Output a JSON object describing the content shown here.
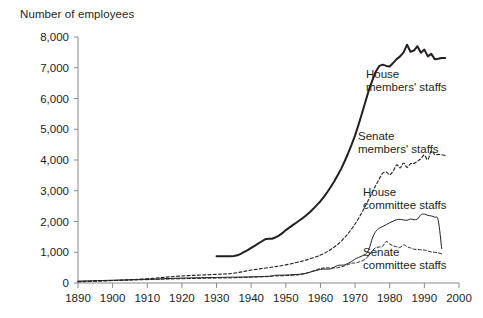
{
  "chart_data": {
    "type": "line",
    "title": "Number of employees",
    "xlabel": "",
    "ylabel": "Number of employees",
    "xlim": [
      1890,
      2000
    ],
    "ylim": [
      0,
      8000
    ],
    "xticks": [
      1890,
      1900,
      1910,
      1920,
      1930,
      1940,
      1950,
      1960,
      1970,
      1980,
      1990,
      2000
    ],
    "yticks": [
      0,
      1000,
      2000,
      3000,
      4000,
      5000,
      6000,
      7000,
      8000
    ],
    "xtick_labels": [
      "1890",
      "1900",
      "1910",
      "1920",
      "1930",
      "1940",
      "1950",
      "1960",
      "1970",
      "1980",
      "1990",
      "2000"
    ],
    "ytick_labels": [
      "0",
      "1,000",
      "2,000",
      "3,000",
      "4,000",
      "5,000",
      "6,000",
      "7,000",
      "8,000"
    ],
    "grid": false,
    "legend_position": "inline-annotations",
    "line_color": "#231f20",
    "series": [
      {
        "name": "House members' staffs",
        "style": "solid",
        "width": 2.0,
        "label_x": 1972,
        "label_y": 6550,
        "x": [
          1930,
          1931,
          1932,
          1933,
          1934,
          1935,
          1936,
          1937,
          1938,
          1939,
          1940,
          1941,
          1942,
          1943,
          1944,
          1945,
          1946,
          1947,
          1948,
          1949,
          1950,
          1951,
          1952,
          1953,
          1954,
          1955,
          1956,
          1957,
          1958,
          1959,
          1960,
          1961,
          1962,
          1963,
          1964,
          1965,
          1966,
          1967,
          1968,
          1969,
          1970,
          1971,
          1972,
          1973,
          1974,
          1975,
          1976,
          1977,
          1978,
          1979,
          1980,
          1981,
          1982,
          1983,
          1984,
          1985,
          1986,
          1987,
          1988,
          1989,
          1990,
          1991,
          1992,
          1993,
          1994,
          1995,
          1996
        ],
        "y": [
          870,
          870,
          870,
          870,
          870,
          875,
          900,
          950,
          1010,
          1070,
          1140,
          1210,
          1280,
          1350,
          1420,
          1440,
          1440,
          1480,
          1540,
          1620,
          1720,
          1800,
          1880,
          1960,
          2040,
          2120,
          2210,
          2310,
          2420,
          2540,
          2660,
          2800,
          2960,
          3130,
          3310,
          3510,
          3720,
          3960,
          4220,
          4500,
          4800,
          5150,
          5520,
          5900,
          6280,
          6600,
          6880,
          7060,
          7100,
          7060,
          7040,
          7160,
          7280,
          7370,
          7500,
          7750,
          7520,
          7560,
          7700,
          7490,
          7590,
          7370,
          7450,
          7280,
          7290,
          7320,
          7320
        ]
      },
      {
        "name": "Senate members' staffs",
        "style": "dashed",
        "width": 1.1,
        "label_x": 1972,
        "label_y": 4780,
        "x": [
          1890,
          1900,
          1910,
          1920,
          1930,
          1935,
          1940,
          1945,
          1950,
          1955,
          1957,
          1959,
          1960,
          1961,
          1962,
          1963,
          1964,
          1965,
          1966,
          1967,
          1968,
          1969,
          1970,
          1971,
          1972,
          1973,
          1974,
          1975,
          1976,
          1977,
          1978,
          1979,
          1980,
          1981,
          1982,
          1983,
          1984,
          1985,
          1986,
          1987,
          1988,
          1989,
          1990,
          1991,
          1992,
          1993,
          1994,
          1995,
          1996
        ],
        "y": [
          40,
          80,
          140,
          230,
          280,
          320,
          420,
          500,
          590,
          720,
          790,
          860,
          910,
          960,
          1020,
          1090,
          1170,
          1260,
          1360,
          1480,
          1610,
          1760,
          1920,
          2100,
          2300,
          2510,
          2730,
          2960,
          3180,
          3390,
          3570,
          3610,
          3520,
          3640,
          3840,
          3740,
          3900,
          3760,
          3880,
          3890,
          3960,
          4050,
          4160,
          4010,
          4290,
          4180,
          4180,
          4170,
          4150
        ]
      },
      {
        "name": "House committee staffs",
        "style": "solid",
        "width": 1.0,
        "label_x": 1973,
        "label_y": 2780,
        "x": [
          1890,
          1900,
          1910,
          1920,
          1930,
          1935,
          1940,
          1945,
          1947,
          1950,
          1955,
          1960,
          1963,
          1965,
          1967,
          1969,
          1970,
          1971,
          1972,
          1973,
          1974,
          1975,
          1976,
          1977,
          1978,
          1979,
          1980,
          1981,
          1982,
          1983,
          1984,
          1985,
          1986,
          1987,
          1988,
          1989,
          1990,
          1991,
          1992,
          1993,
          1994,
          1995
        ],
        "y": [
          60,
          90,
          120,
          160,
          180,
          190,
          200,
          220,
          250,
          260,
          300,
          440,
          460,
          570,
          590,
          700,
          780,
          830,
          880,
          930,
          1100,
          1460,
          1680,
          1780,
          1840,
          1900,
          1960,
          2010,
          2060,
          2070,
          2050,
          2040,
          2080,
          2060,
          2080,
          2220,
          2240,
          2200,
          2180,
          2140,
          2040,
          1120
        ]
      },
      {
        "name": "Senate committee staffs",
        "style": "dashed",
        "width": 1.0,
        "label_x": 1973,
        "label_y": 700,
        "x": [
          1890,
          1900,
          1910,
          1920,
          1930,
          1935,
          1940,
          1945,
          1947,
          1950,
          1955,
          1960,
          1963,
          1965,
          1967,
          1969,
          1970,
          1971,
          1972,
          1973,
          1974,
          1975,
          1976,
          1977,
          1978,
          1979,
          1980,
          1981,
          1982,
          1983,
          1984,
          1985,
          1986,
          1987,
          1988,
          1989,
          1990,
          1991,
          1992,
          1993,
          1994,
          1995
        ],
        "y": [
          50,
          80,
          110,
          140,
          160,
          170,
          190,
          210,
          230,
          240,
          290,
          470,
          490,
          500,
          560,
          640,
          650,
          680,
          720,
          780,
          900,
          1050,
          1150,
          1170,
          1200,
          1350,
          1270,
          1210,
          1180,
          1160,
          1240,
          1180,
          1140,
          1100,
          1090,
          1080,
          1070,
          1040,
          1010,
          1000,
          980,
          950
        ]
      }
    ],
    "annotations": [
      {
        "text_line1": "House",
        "text_line2": "members' staffs"
      },
      {
        "text_line1": "Senate",
        "text_line2": "members' staffs"
      },
      {
        "text_line1": "House",
        "text_line2": "committee staffs"
      },
      {
        "text_line1": "Senate",
        "text_line2": "committee staffs"
      }
    ]
  }
}
